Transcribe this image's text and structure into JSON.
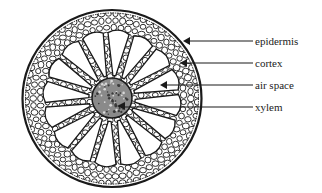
{
  "diagram": {
    "labels": [
      {
        "id": "epidermis",
        "text": "epidermis"
      },
      {
        "id": "cortex",
        "text": "cortex"
      },
      {
        "id": "air-space",
        "text": "air space"
      },
      {
        "id": "xylem",
        "text": "xylem"
      }
    ],
    "colors": {
      "ink": "#1a1a1a",
      "xylem_fill": "#8a8a8a",
      "background": "#ffffff"
    },
    "radial_air_spaces": 16
  }
}
